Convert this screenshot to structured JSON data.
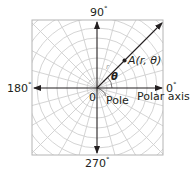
{
  "diagram": {
    "labels": {
      "deg90": "90",
      "deg180": "180",
      "deg0": "0",
      "deg270": "270",
      "degree_symbol": "°",
      "origin": "0",
      "pole": "Pole",
      "polar_axis": "Polar axis",
      "point_name": "A",
      "point_coords": "(r, θ)",
      "theta": "θ",
      "r": "r"
    },
    "colors": {
      "axis": "#231f20",
      "grid": "#c8c8c8",
      "border": "#b4b4b4",
      "text": "#231f20"
    }
  }
}
